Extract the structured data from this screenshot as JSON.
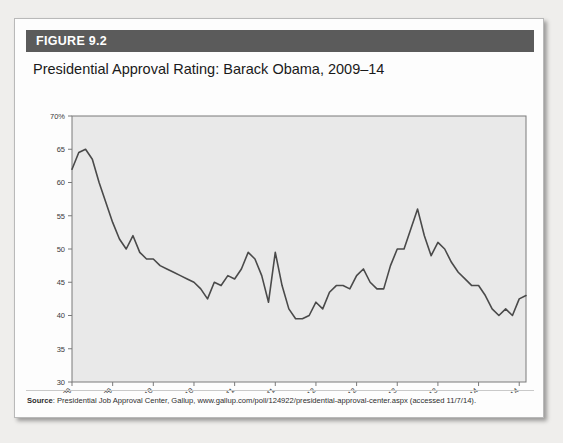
{
  "figure": {
    "badge": "FIGURE 9.2",
    "title": "Presidential Approval Rating: Barack Obama, 2009–14",
    "source_prefix": "Source",
    "source_text": ": Presidential Job Approval Center, Gallup, www.gallup.com/poll/124922/presidential-approval-center.aspx (accessed 11/7/14)."
  },
  "colors": {
    "header_bar": "#5b5b5b",
    "plot_background": "#e9e9e9",
    "line": "#4a4a4a",
    "axis": "#7a7a7a",
    "page": "#efeeec"
  },
  "chart_data": {
    "type": "line",
    "title": "Presidential Approval Rating: Barack Obama, 2009–14",
    "xlabel": "",
    "ylabel": "",
    "ylim": [
      30,
      70
    ],
    "yticks": [
      30,
      35,
      40,
      45,
      50,
      55,
      60,
      65,
      70
    ],
    "ytick_labels": [
      "30",
      "35",
      "40",
      "45",
      "50",
      "55",
      "60",
      "65",
      "70%"
    ],
    "xtick_labels": [
      "Feb 09",
      "Aug 09",
      "Feb 10",
      "Aug 10",
      "Feb 11",
      "Aug 11",
      "Feb 12",
      "Aug 12",
      "Feb 13",
      "Aug 13",
      "Feb 14",
      "Aug 14"
    ],
    "xtick_positions": [
      0,
      6,
      12,
      18,
      24,
      30,
      36,
      42,
      48,
      54,
      60,
      66
    ],
    "grid": false,
    "legend": "none",
    "series": [
      {
        "name": "Approval Rating",
        "x": [
          0,
          1,
          2,
          3,
          4,
          5,
          6,
          7,
          8,
          9,
          10,
          11,
          12,
          13,
          14,
          15,
          16,
          17,
          18,
          19,
          20,
          21,
          22,
          23,
          24,
          25,
          26,
          27,
          28,
          29,
          30,
          31,
          32,
          33,
          34,
          35,
          36,
          37,
          38,
          39,
          40,
          41,
          42,
          43,
          44,
          45,
          46,
          47,
          48,
          49,
          50,
          51,
          52,
          53,
          54,
          55,
          56,
          57,
          58,
          59,
          60,
          61,
          62,
          63,
          64,
          65,
          66,
          67
        ],
        "values": [
          62.0,
          64.5,
          65.0,
          63.5,
          60.0,
          57.0,
          54.0,
          51.5,
          50.0,
          52.0,
          49.5,
          48.5,
          48.5,
          47.5,
          47.0,
          46.5,
          46.0,
          45.5,
          45.0,
          44.0,
          42.5,
          45.0,
          44.5,
          46.0,
          45.5,
          47.0,
          49.5,
          48.5,
          46.0,
          42.0,
          49.5,
          44.5,
          41.0,
          39.5,
          39.5,
          40.0,
          42.0,
          41.0,
          43.5,
          44.5,
          44.5,
          44.0,
          46.0,
          47.0,
          45.0,
          44.0,
          44.0,
          47.5,
          50.0,
          50.0,
          53.0,
          56.0,
          52.0,
          49.0,
          51.0,
          50.0,
          48.0,
          46.5,
          45.5,
          44.5,
          44.5,
          43.0,
          41.0,
          40.0,
          41.0,
          40.0,
          42.5,
          43.0
        ]
      }
    ]
  }
}
